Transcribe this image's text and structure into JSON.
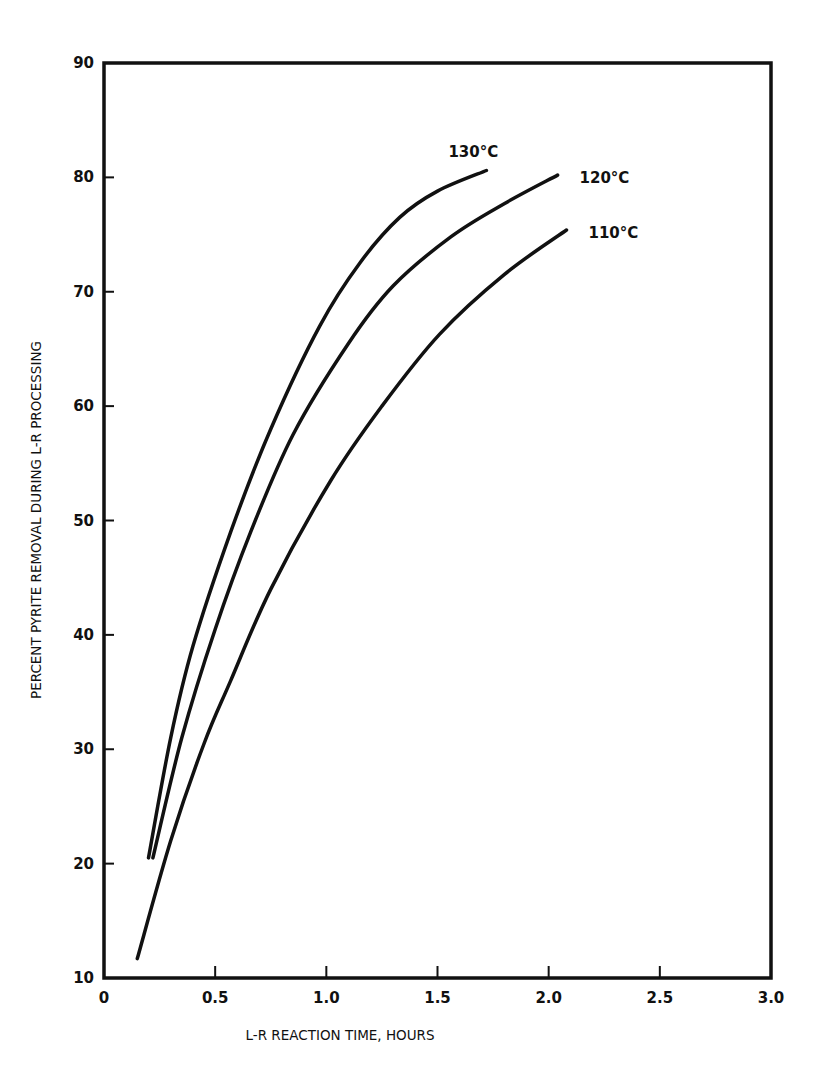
{
  "chart_data": {
    "type": "line",
    "title": "",
    "xlabel": "L-R REACTION TIME, HOURS",
    "ylabel": "PERCENT PYRITE REMOVAL DURING L-R PROCESSING",
    "xlim": [
      0,
      3.0
    ],
    "ylim": [
      10,
      90
    ],
    "x_ticks": [
      "0",
      "0.5",
      "1.0",
      "1.5",
      "2.0",
      "2.5",
      "3.0"
    ],
    "x_tick_values": [
      0,
      0.5,
      1.0,
      1.5,
      2.0,
      2.5,
      3.0
    ],
    "y_ticks": [
      "10",
      "20",
      "30",
      "40",
      "50",
      "60",
      "70",
      "80",
      "90"
    ],
    "y_tick_values": [
      10,
      20,
      30,
      40,
      50,
      60,
      70,
      80,
      90
    ],
    "grid": false,
    "legend": "inline labels at curve ends",
    "series": [
      {
        "name": "130°C",
        "label": "130°C",
        "x": [
          0.2,
          0.3,
          0.4,
          0.57,
          0.75,
          0.97,
          1.15,
          1.33,
          1.5,
          1.72
        ],
        "y": [
          20.5,
          31.0,
          39.0,
          49.0,
          58.0,
          67.0,
          72.5,
          76.5,
          78.8,
          80.6
        ]
      },
      {
        "name": "120°C",
        "label": "120°C",
        "x": [
          0.22,
          0.35,
          0.5,
          0.66,
          0.85,
          1.1,
          1.3,
          1.56,
          1.8,
          2.04
        ],
        "y": [
          20.5,
          31.0,
          40.5,
          49.0,
          57.5,
          65.5,
          70.5,
          74.8,
          77.7,
          80.2
        ]
      },
      {
        "name": "110°C",
        "label": "110°C",
        "x": [
          0.15,
          0.3,
          0.45,
          0.57,
          0.75,
          1.02,
          1.25,
          1.51,
          1.8,
          2.08
        ],
        "y": [
          11.7,
          22.0,
          30.5,
          36.0,
          44.0,
          53.5,
          60.0,
          66.3,
          71.5,
          75.4
        ]
      }
    ]
  }
}
